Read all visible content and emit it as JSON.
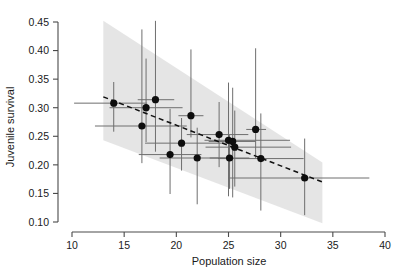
{
  "chart_data": {
    "type": "scatter",
    "title": "",
    "subtitle": "",
    "xlabel": "Population size",
    "ylabel": "Juvenile survival",
    "xlim": [
      10,
      40
    ],
    "ylim": [
      0.1,
      0.45
    ],
    "xticks": [
      10,
      15,
      20,
      25,
      30,
      35,
      40
    ],
    "xtick_labels": [
      "10",
      "15",
      "20",
      "25",
      "30",
      "35",
      "40"
    ],
    "yticks": [
      0.1,
      0.15,
      0.2,
      0.25,
      0.3,
      0.35,
      0.4,
      0.45
    ],
    "ytick_labels": [
      "0.10",
      "0.15",
      "0.20",
      "0.25",
      "0.30",
      "0.35",
      "0.40",
      "0.45"
    ],
    "grid": false,
    "legend": null,
    "legend_position": "none",
    "annotations": [],
    "points": [
      {
        "x": 14.0,
        "y": 0.308,
        "xerr_low": 10.2,
        "xerr_high": 17.2,
        "yerr_low": 0.258,
        "yerr_high": 0.345
      },
      {
        "x": 16.7,
        "y": 0.268,
        "xerr_low": 12.2,
        "xerr_high": 21.0,
        "yerr_low": 0.203,
        "yerr_high": 0.437
      },
      {
        "x": 17.1,
        "y": 0.3,
        "xerr_low": 13.6,
        "xerr_high": 20.6,
        "yerr_low": 0.24,
        "yerr_high": 0.386
      },
      {
        "x": 18.0,
        "y": 0.314,
        "xerr_low": 16.3,
        "xerr_high": 19.8,
        "yerr_low": 0.223,
        "yerr_high": 0.452
      },
      {
        "x": 19.4,
        "y": 0.218,
        "xerr_low": 16.4,
        "xerr_high": 22.4,
        "yerr_low": 0.149,
        "yerr_high": 0.298
      },
      {
        "x": 21.4,
        "y": 0.286,
        "xerr_low": 20.2,
        "xerr_high": 22.6,
        "yerr_low": 0.248,
        "yerr_high": 0.402
      },
      {
        "x": 20.5,
        "y": 0.238,
        "xerr_low": 17.0,
        "xerr_high": 25.5,
        "yerr_low": 0.19,
        "yerr_high": 0.282
      },
      {
        "x": 22.0,
        "y": 0.212,
        "xerr_low": 18.4,
        "xerr_high": 25.2,
        "yerr_low": 0.131,
        "yerr_high": 0.265
      },
      {
        "x": 24.1,
        "y": 0.253,
        "xerr_low": 21.0,
        "xerr_high": 26.9,
        "yerr_low": 0.196,
        "yerr_high": 0.31
      },
      {
        "x": 25.0,
        "y": 0.243,
        "xerr_low": 22.7,
        "xerr_high": 30.9,
        "yerr_low": 0.145,
        "yerr_high": 0.344
      },
      {
        "x": 25.4,
        "y": 0.241,
        "xerr_low": 23.1,
        "xerr_high": 27.6,
        "yerr_low": 0.143,
        "yerr_high": 0.335
      },
      {
        "x": 25.1,
        "y": 0.212,
        "xerr_low": 23.2,
        "xerr_high": 27.0,
        "yerr_low": 0.158,
        "yerr_high": 0.252
      },
      {
        "x": 25.6,
        "y": 0.231,
        "xerr_low": 22.8,
        "xerr_high": 31.0,
        "yerr_low": 0.162,
        "yerr_high": 0.295
      },
      {
        "x": 27.6,
        "y": 0.262,
        "xerr_low": 26.7,
        "xerr_high": 28.6,
        "yerr_low": 0.212,
        "yerr_high": 0.404
      },
      {
        "x": 28.1,
        "y": 0.211,
        "xerr_low": 24.0,
        "xerr_high": 32.2,
        "yerr_low": 0.12,
        "yerr_high": 0.29
      },
      {
        "x": 32.3,
        "y": 0.177,
        "xerr_low": 25.0,
        "xerr_high": 38.5,
        "yerr_low": 0.112,
        "yerr_high": 0.246
      }
    ],
    "fit_line": {
      "style": "dashed",
      "x_start": 13.0,
      "y_start": 0.319,
      "x_end": 34.0,
      "y_end": 0.17
    },
    "confidence_band": {
      "x_start": 13.0,
      "x_end": 34.0,
      "upper_start": 0.452,
      "upper_end": 0.204,
      "lower_start": 0.243,
      "lower_end": 0.098,
      "fill": "#9a9a9a",
      "opacity": 0.26
    }
  },
  "colors": {
    "point": "#0d0d0d",
    "error_bar": "#6e6e6e",
    "axis": "#4a4a4a",
    "band": "#9a9a9a",
    "background": "#ffffff"
  }
}
